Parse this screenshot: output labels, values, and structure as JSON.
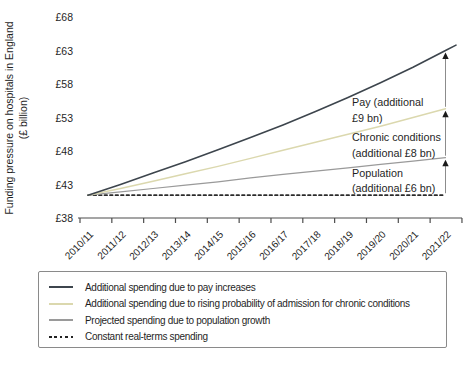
{
  "figure": {
    "legend": {
      "items": [
        {
          "label": "Additional spending due to pay increases",
          "color": "#3d454d",
          "style": "solid"
        },
        {
          "label": "Additional spending due to rising probability of admission for chronic conditions",
          "color": "#dbd8ae",
          "style": "solid"
        },
        {
          "label": "Projected spending due to population growth",
          "color": "#9a9a9a",
          "style": "solid"
        },
        {
          "label": "Constant real-terms spending",
          "color": "#222222",
          "style": "dashed"
        }
      ]
    }
  },
  "chart_data": {
    "type": "line",
    "title": "",
    "xlabel": "",
    "ylabel": "Funding pressure on hospitals in England (£ billion)",
    "ylabel_lines": [
      "Funding pressure on hospitals in England",
      "(£ billion)"
    ],
    "ylim": [
      38,
      68
    ],
    "yticks": [
      38,
      43,
      48,
      53,
      58,
      63,
      68
    ],
    "ytick_labels": [
      "£38",
      "£43",
      "£48",
      "£53",
      "£58",
      "£63",
      "£68"
    ],
    "grid": false,
    "legend_position": "bottom-box",
    "categories": [
      "2010/11",
      "2011/12",
      "2012/13",
      "2013/14",
      "2014/15",
      "2015/16",
      "2016/17",
      "2017/18",
      "2018/19",
      "2019/20",
      "2020/21",
      "2021/22"
    ],
    "series": [
      {
        "name": "pay",
        "legend": "Additional spending due to pay increases",
        "color": "#3d454d",
        "dash": false,
        "width": 1.6,
        "values": [
          41.4,
          43.0,
          44.7,
          46.4,
          48.2,
          50.0,
          51.9,
          53.9,
          56.0,
          58.2,
          60.5,
          63.0
        ]
      },
      {
        "name": "chronic",
        "legend": "Additional spending due to rising probability of admission for chronic conditions",
        "color": "#dbd8ae",
        "dash": false,
        "width": 1.4,
        "values": [
          41.4,
          42.4,
          43.5,
          44.6,
          45.7,
          46.9,
          48.1,
          49.3,
          50.5,
          51.7,
          53.0,
          54.3
        ]
      },
      {
        "name": "population",
        "legend": "Projected spending due to population growth",
        "color": "#9a9a9a",
        "dash": false,
        "width": 1.2,
        "values": [
          41.4,
          41.9,
          42.4,
          42.9,
          43.4,
          44.0,
          44.5,
          45.0,
          45.5,
          46.0,
          46.5,
          47.0
        ]
      },
      {
        "name": "constant",
        "legend": "Constant real-terms spending",
        "color": "#2b2b2b",
        "dash": true,
        "width": 1.7,
        "values": [
          41.4,
          41.4,
          41.4,
          41.4,
          41.4,
          41.4,
          41.4,
          41.4,
          41.4,
          41.4,
          41.4,
          41.4
        ]
      }
    ],
    "annotations": [
      {
        "name": "pay",
        "x": 352,
        "y": 106,
        "dy": 16,
        "lines": [
          "Pay (additional",
          "£9 bn)"
        ]
      },
      {
        "name": "chronic",
        "x": 352,
        "y": 141,
        "dy": 16,
        "lines": [
          "Chronic conditions",
          "(additional £8 bn)"
        ]
      },
      {
        "name": "population",
        "x": 352,
        "y": 177,
        "dy": 15,
        "lines": [
          "Population",
          "(additional £6 bn)"
        ]
      }
    ],
    "arrows": [
      {
        "from": "constant",
        "to": "population",
        "label": "additional £6 bn"
      },
      {
        "from": "population",
        "to": "chronic",
        "label": "additional £8 bn"
      },
      {
        "from": "chronic",
        "to": "pay",
        "label": "additional £9 bn"
      }
    ]
  }
}
